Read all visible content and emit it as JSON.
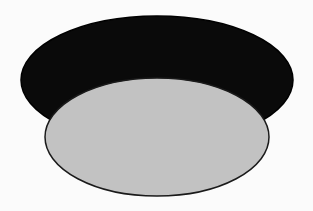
{
  "diagram": {
    "shapes": [
      {
        "id": "back-ellipse",
        "type": "ellipse",
        "cx": 157,
        "cy": 80,
        "rx": 136,
        "ry": 64,
        "fill": "#0a0a0a",
        "stroke": "#000000"
      },
      {
        "id": "front-ellipse",
        "type": "ellipse",
        "cx": 157,
        "cy": 137,
        "rx": 112,
        "ry": 59,
        "fill": "#c2c2c2",
        "stroke": "#1a1a1a"
      }
    ],
    "background": "#fbfbfb"
  }
}
